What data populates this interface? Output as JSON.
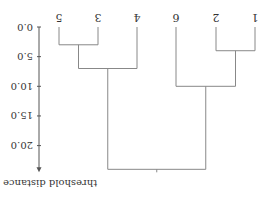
{
  "chart_data": {
    "type": "dendrogram",
    "orientation": "rotated-180",
    "axis": {
      "label": "threshold distance",
      "ticks": [
        0.0,
        5.0,
        10.0,
        15.0,
        20.0
      ],
      "tick_labels": [
        "0.0",
        "5.0",
        "10.0",
        "15.0",
        "20.0"
      ],
      "range": [
        0,
        24.5
      ]
    },
    "leaves": [
      "5",
      "3",
      "4",
      "6",
      "2",
      "1"
    ],
    "merges": [
      {
        "left": "5",
        "right": "3",
        "height": 3.0
      },
      {
        "left": "(5,3)",
        "right": "4",
        "height": 7.0
      },
      {
        "left": "2",
        "right": "1",
        "height": 4.0
      },
      {
        "left": "6",
        "right": "(2,1)",
        "height": 10.0
      },
      {
        "left": "((5,3),4)",
        "right": "(6,(2,1))",
        "height": 24.0
      }
    ],
    "colors": {
      "line": "#888888",
      "text": "#333333",
      "axis": "#555555"
    }
  },
  "layout": {
    "leaf_x": {
      "5": 206,
      "3": 167,
      "4": 128,
      "6": 89,
      "2": 49,
      "1": 10
    },
    "y_zero": 174,
    "px_per_unit": 5.93,
    "axis_x": 226
  }
}
